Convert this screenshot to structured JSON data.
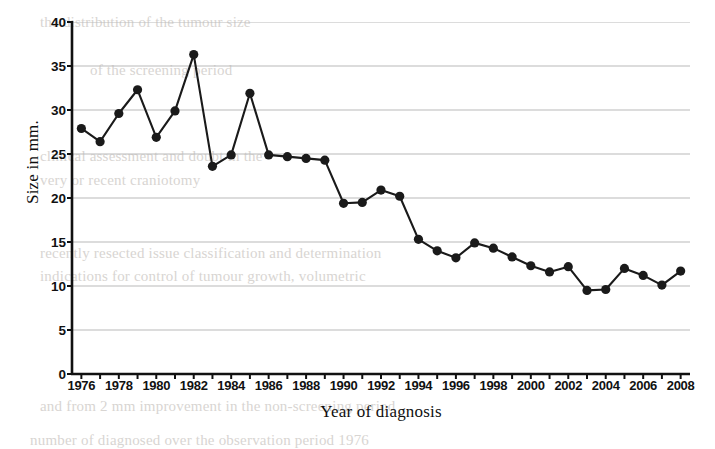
{
  "chart_data": {
    "type": "line",
    "title": "",
    "xlabel": "Year of diagnosis",
    "ylabel": "Size in mm.",
    "xlim": [
      1975.5,
      2008.5
    ],
    "ylim": [
      0,
      40
    ],
    "ytick_step": 5,
    "yticks": [
      40,
      35,
      30,
      25,
      20,
      15,
      10,
      5,
      0
    ],
    "xticks": [
      1976,
      1978,
      1980,
      1982,
      1984,
      1986,
      1988,
      1990,
      1992,
      1994,
      1996,
      1998,
      2000,
      2002,
      2004,
      2006,
      2008
    ],
    "xtick_step": 2,
    "grid": "horizontal",
    "legend": "none",
    "marker": "filled-circle",
    "line_color": "#1a1a1a",
    "marker_color": "#1a1a1a",
    "grid_color": "#b9b9b9",
    "x": [
      1976,
      1977,
      1978,
      1979,
      1980,
      1981,
      1982,
      1983,
      1984,
      1985,
      1986,
      1987,
      1988,
      1989,
      1990,
      1991,
      1992,
      1993,
      1994,
      1995,
      1996,
      1997,
      1998,
      1999,
      2000,
      2001,
      2002,
      2003,
      2004,
      2005,
      2006,
      2007,
      2008
    ],
    "values": [
      27.9,
      26.4,
      29.6,
      32.3,
      26.9,
      29.9,
      36.3,
      23.6,
      24.9,
      31.9,
      24.9,
      24.7,
      24.5,
      24.3,
      19.4,
      19.5,
      20.9,
      20.2,
      15.3,
      14.0,
      13.2,
      14.9,
      14.3,
      13.3,
      12.3,
      11.6,
      12.2,
      9.5,
      9.6,
      12.0,
      11.2,
      10.1,
      11.7
    ]
  },
  "axes": {
    "y_title": "Size in mm.",
    "x_title": "Year of diagnosis",
    "y_tick_labels": [
      "40",
      "35",
      "30",
      "25",
      "20",
      "15",
      "10",
      "5",
      "0"
    ],
    "x_tick_labels": [
      "1976",
      "1978",
      "1980",
      "1982",
      "1984",
      "1986",
      "1988",
      "1990",
      "1992",
      "1994",
      "1996",
      "1998",
      "2000",
      "2002",
      "2004",
      "2006",
      "2008"
    ]
  },
  "bleed_through": {
    "lines": [
      "the distribution of the tumour size",
      "of the screening period",
      "clinical assessment and doubt in the",
      "very or recent craniotomy",
      "recently resected issue classification and determination",
      "indications for control of tumour growth, volumetric",
      "and from 2 mm improvement in the non-screening period",
      "number of diagnosed over the observation period 1976"
    ]
  }
}
